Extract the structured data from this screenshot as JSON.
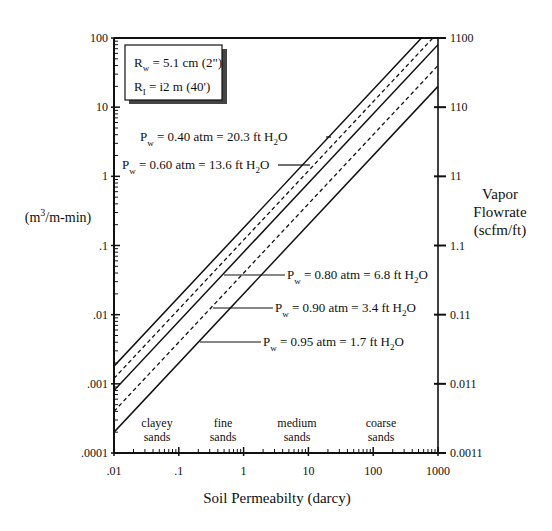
{
  "chart_data": {
    "type": "line",
    "title": "",
    "xlabel": "Soil Permeabilty (darcy)",
    "ylabel_left": "(m3/m-min)",
    "ylabel_right": [
      "Vapor",
      "Flowrate",
      "(scfm/ft)"
    ],
    "xscale": "log",
    "yscale": "log",
    "xlim": [
      0.01,
      1000
    ],
    "ylim": [
      0.0001,
      100
    ],
    "x_ticks": [
      ".01",
      ".1",
      "1",
      "10",
      "100",
      "1000"
    ],
    "y_ticks_left": [
      ".0001",
      ".001",
      ".01",
      ".1",
      "1",
      "10",
      "100"
    ],
    "y_ticks_right": [
      "0.0011",
      "0.011",
      "0.11",
      "1.1",
      "11",
      "110",
      "1100"
    ],
    "legend_box": [
      "Rw = 5.1 cm (2\")",
      "RI = i2 m (40')"
    ],
    "soil_regions": [
      {
        "label": [
          "clayey",
          "sands"
        ],
        "x": 0.03
      },
      {
        "label": [
          "fine",
          "sands"
        ],
        "x": 0.3
      },
      {
        "label": [
          "medium",
          "sands"
        ],
        "x": 4
      },
      {
        "label": [
          "coarse",
          "sands"
        ],
        "x": 100
      }
    ],
    "series": [
      {
        "name": "Pw = 0.40 atm = 20.3 ft H2O",
        "style": "solid",
        "x": [
          0.01,
          1000
        ],
        "values": [
          0.0018,
          180
        ]
      },
      {
        "name": "Pw = 0.60 atm = 13.6 ft H2O",
        "style": "dashed",
        "x": [
          0.01,
          1000
        ],
        "values": [
          0.0012,
          120
        ]
      },
      {
        "name": "Pw = 0.80 atm = 6.8 ft H2O",
        "style": "solid",
        "x": [
          0.01,
          1000
        ],
        "values": [
          0.0008,
          80
        ]
      },
      {
        "name": "Pw = 0.90 atm = 3.4 ft H2O",
        "style": "dashed",
        "x": [
          0.01,
          1000
        ],
        "values": [
          0.0004,
          40
        ]
      },
      {
        "name": "Pw = 0.95 atm = 1.7 ft H2O",
        "style": "solid",
        "x": [
          0.01,
          1000
        ],
        "values": [
          0.0002,
          20
        ]
      }
    ],
    "grid": false
  },
  "labels": {
    "legend_rw_main": "R",
    "legend_rw_sub": "w",
    "legend_rw_rest": " = 5.1 cm (2\")",
    "legend_ri_main": "R",
    "legend_ri_sub": "I",
    "legend_ri_rest": " = i2 m (40')",
    "pw_main": "P",
    "pw_sub": "w",
    "h2o_h": " ft H",
    "h2o_2": "2",
    "h2o_o": "O",
    "p40_mid": " = 0.40 atm = 20.3",
    "p60_mid": " = 0.60 atm = 13.6",
    "p80_mid": " = 0.80 atm = 6.8",
    "p90_mid": " = 0.90 atm = 3.4",
    "p95_mid": " = 0.95 atm = 1.7",
    "ylabel_left_pre": "(m",
    "ylabel_left_sup": "3",
    "ylabel_left_post": "/m-min)",
    "ylabel_right_1": "Vapor",
    "ylabel_right_2": "Flowrate",
    "ylabel_right_3": "(scfm/ft)",
    "xlabel": "Soil Permeabilty (darcy)",
    "x_ticks": [
      ".01",
      ".1",
      "1",
      "10",
      "100",
      "1000"
    ],
    "y_ticks_left": [
      ".0001",
      ".001",
      ".01",
      ".1",
      "1",
      "10",
      "100"
    ],
    "y_ticks_right": [
      "0.0011",
      "0.011",
      "0.11",
      "1.1",
      "11",
      "110",
      "1100"
    ],
    "regions": [
      [
        "clayey",
        "sands"
      ],
      [
        "fine",
        "sands"
      ],
      [
        "medium",
        "sands"
      ],
      [
        "coarse",
        "sands"
      ]
    ]
  }
}
